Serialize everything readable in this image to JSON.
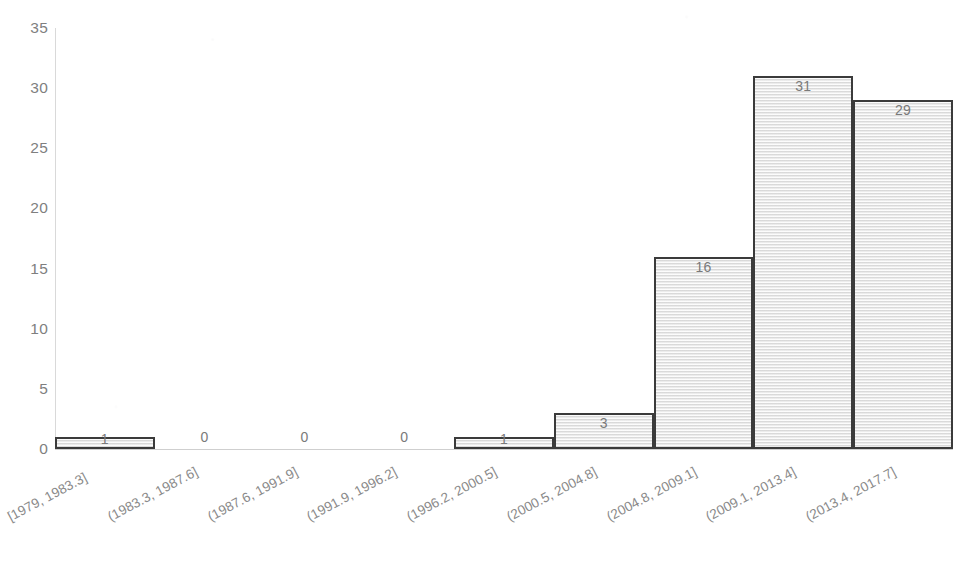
{
  "chart_data": {
    "type": "bar",
    "title": "",
    "subtitle": "",
    "xlabel": "",
    "ylabel": "",
    "categories": [
      "[1979, 1983.3]",
      "(1983.3, 1987.6]",
      "(1987.6, 1991.9]",
      "(1991.9, 1996.2]",
      "(1996.2, 2000.5]",
      "(2000.5, 2004.8]",
      "(2004.8, 2009.1]",
      "(2009.1, 2013.4]",
      "(2013.4, 2017.7]"
    ],
    "values": [
      1,
      0,
      0,
      0,
      1,
      3,
      16,
      31,
      29
    ],
    "data_labels": [
      "1",
      "0",
      "0",
      "0",
      "1",
      "3",
      "16",
      "29",
      "31"
    ],
    "ylim": [
      0,
      35
    ],
    "yticks": [
      0,
      5,
      10,
      15,
      20,
      25,
      30,
      35
    ],
    "ytick_labels": [
      "0",
      "5",
      "10",
      "15",
      "20",
      "25",
      "30",
      "35"
    ],
    "grid": false,
    "legend": false,
    "legend_position": "none",
    "bin_width": 4.3,
    "bar_style": "histogram-contiguous",
    "colors": {
      "bar_fill": "#e9e9e9",
      "bar_border": "#3b3b3b",
      "axis_line": "#d0d0d0",
      "tick_label": "#7f7f7f",
      "data_label": "#7a7a7a",
      "background": "#ffffff"
    }
  },
  "axes": {
    "y": {
      "ticks": [
        {
          "label": "35",
          "value": 35
        },
        {
          "label": "30",
          "value": 30
        },
        {
          "label": "25",
          "value": 25
        },
        {
          "label": "20",
          "value": 20
        },
        {
          "label": "15",
          "value": 15
        },
        {
          "label": "10",
          "value": 10
        },
        {
          "label": "5",
          "value": 5
        },
        {
          "label": "0",
          "value": 0
        }
      ]
    },
    "x": {
      "ticks": [
        {
          "label": "[1979, 1983.3]"
        },
        {
          "label": "(1983.3, 1987.6]"
        },
        {
          "label": "(1987.6, 1991.9]"
        },
        {
          "label": "(1991.9, 1996.2]"
        },
        {
          "label": "(1996.2, 2000.5]"
        },
        {
          "label": "(2000.5, 2004.8]"
        },
        {
          "label": "(2004.8, 2009.1]"
        },
        {
          "label": "(2009.1, 2013.4]"
        },
        {
          "label": "(2013.4, 2017.7]"
        }
      ]
    }
  },
  "bars": [
    {
      "category": "[1979, 1983.3]",
      "value": 1,
      "label": "1"
    },
    {
      "category": "(1983.3, 1987.6]",
      "value": 0,
      "label": "0"
    },
    {
      "category": "(1987.6, 1991.9]",
      "value": 0,
      "label": "0"
    },
    {
      "category": "(1991.9, 1996.2]",
      "value": 0,
      "label": "0"
    },
    {
      "category": "(1996.2, 2000.5]",
      "value": 1,
      "label": "1"
    },
    {
      "category": "(2000.5, 2004.8]",
      "value": 3,
      "label": "3"
    },
    {
      "category": "(2004.8, 2009.1]",
      "value": 16,
      "label": "16"
    },
    {
      "category": "(2009.1, 2013.4]",
      "value": 31,
      "label": "31"
    },
    {
      "category": "(2013.4, 2017.7]",
      "value": 29,
      "label": "29"
    }
  ]
}
